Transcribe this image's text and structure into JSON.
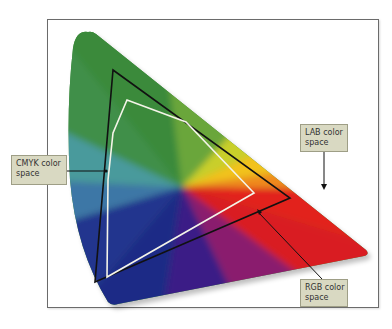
{
  "diagram": {
    "type": "color-gamut-comparison",
    "labels": {
      "cmyk": {
        "line1": "CMYK color",
        "line2": "space"
      },
      "lab": {
        "line1": "LAB color",
        "line2": "space"
      },
      "rgb": {
        "line1": "RGB color",
        "line2": "space"
      }
    },
    "colors": {
      "frame_border": "#6b6b6b",
      "label_fill": "#d9d9c2",
      "label_border": "#9e9e86",
      "cmyk_outline": "#111111",
      "rgb_outline": "#f4f4e8",
      "green": "#3f8f3a",
      "yellow": "#f2d21a",
      "orange": "#f08a1c",
      "red": "#e2231f",
      "purple": "#5b1e8c",
      "navy": "#1d2a86",
      "teal": "#4a9a9c"
    },
    "shapes": {
      "lab_space": "horseshoe/triangle spectrum locus (largest gamut)",
      "cmyk_space": "black outline polygon",
      "rgb_space": "white outline polygon"
    }
  }
}
